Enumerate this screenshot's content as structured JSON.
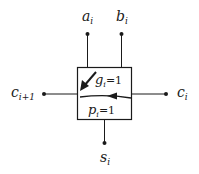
{
  "diagram": {
    "type": "full-adder cell (carry generate/propagate)",
    "inputs": {
      "a": {
        "base": "a",
        "sub": "i"
      },
      "b": {
        "base": "b",
        "sub": "i"
      },
      "carry_in": {
        "base": "c",
        "sub": "i"
      }
    },
    "outputs": {
      "carry_out": {
        "base": "c",
        "sub": "i+1"
      },
      "sum": {
        "base": "s",
        "sub": "i"
      }
    },
    "box": {
      "generate": {
        "base": "g",
        "sub": "i",
        "eq": "=1"
      },
      "propagate": {
        "base": "p",
        "sub": "i",
        "eq": "=1"
      }
    },
    "colors": {
      "stroke": "#1a1a1a",
      "background": "#ffffff"
    }
  }
}
